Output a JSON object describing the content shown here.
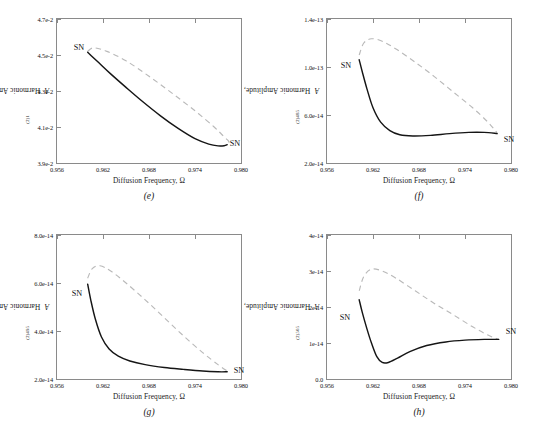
{
  "figure": {
    "panels": [
      {
        "id": "e",
        "caption": "(e)",
        "xlabel_text": "Diffusion Frequency, Ω",
        "ylabel_prefix": "Harmonic Amplitude, ",
        "ylabel_symbol": "A",
        "ylabel_sub": "(2)1",
        "xticks": [
          "0.956",
          "0.962",
          "0.968",
          "0.974",
          "0.980"
        ],
        "yticks": [
          "4.7e-2",
          "4.5e-2",
          "4.3e-2",
          "4.1e-2",
          "3.9e-2"
        ],
        "sn_labels": [
          "SN",
          "SN"
        ]
      },
      {
        "id": "f",
        "caption": "(f)",
        "xlabel_text": "Diffusion Frequency, Ω",
        "ylabel_prefix": "Harmonic Amplitude, ",
        "ylabel_symbol": "A",
        "ylabel_sub": "(2)485",
        "xticks": [
          "0.956",
          "0.962",
          "0.968",
          "0.974",
          "0.980"
        ],
        "yticks": [
          "1.4e-13",
          "1.0e-13",
          "6.0e-14",
          "2.0e-14"
        ],
        "sn_labels": [
          "SN",
          "SN"
        ]
      },
      {
        "id": "g",
        "caption": "(g)",
        "xlabel_text": "Diffusion Frequency, Ω",
        "ylabel_prefix": "Harmonic Amplitude, ",
        "ylabel_symbol": "A",
        "ylabel_sub": "(2)495",
        "xticks": [
          "0.956",
          "0.962",
          "0.968",
          "0.974",
          "0.980"
        ],
        "yticks": [
          "8.0e-14",
          "6.0e-14",
          "4.0e-14",
          "2.0e-14"
        ],
        "sn_labels": [
          "SN",
          "SN"
        ]
      },
      {
        "id": "h",
        "caption": "(h)",
        "xlabel_text": "Diffusion Frequency, Ω",
        "ylabel_prefix": "Harmonic Amplitude, ",
        "ylabel_symbol": "A",
        "ylabel_sub": "(2)505",
        "xticks": [
          "0.956",
          "0.962",
          "0.968",
          "0.974",
          "0.980"
        ],
        "yticks": [
          "4e-14",
          "3e-14",
          "2e-14",
          "1e-14",
          "0.0"
        ],
        "sn_labels": [
          "SN",
          "SN"
        ]
      }
    ]
  },
  "chart_data": [
    {
      "type": "line",
      "panel": "e",
      "title": "(e)",
      "xlabel": "Diffusion Frequency, Ω",
      "ylabel": "Harmonic Amplitude, A(2)1",
      "xlim": [
        0.956,
        0.98
      ],
      "ylim": [
        0.039,
        0.047
      ],
      "grid": false,
      "legend": "none",
      "annotations": [
        {
          "text": "SN",
          "x": 0.9595,
          "y": 0.0452
        },
        {
          "text": "SN",
          "x": 0.9788,
          "y": 0.04
        }
      ],
      "series": [
        {
          "name": "stable branch (solid)",
          "style": "solid",
          "color": "#151515",
          "x": [
            0.96,
            0.9605,
            0.9615,
            0.963,
            0.965,
            0.9672,
            0.9695,
            0.9718,
            0.974,
            0.9758,
            0.977,
            0.9778,
            0.9782
          ],
          "y": [
            0.04515,
            0.04495,
            0.04455,
            0.04395,
            0.0432,
            0.0424,
            0.04162,
            0.04092,
            0.04035,
            0.04005,
            0.03995,
            0.03996,
            0.04002
          ]
        },
        {
          "name": "unstable branch (dashed)",
          "style": "dashed",
          "color": "#b9b9b9",
          "x": [
            0.96,
            0.9608,
            0.9625,
            0.965,
            0.968,
            0.971,
            0.974,
            0.9765,
            0.9778,
            0.9784,
            0.9784
          ],
          "y": [
            0.0452,
            0.0454,
            0.0452,
            0.04468,
            0.04382,
            0.04288,
            0.0419,
            0.041,
            0.04045,
            0.0402,
            0.04002
          ]
        }
      ]
    },
    {
      "type": "line",
      "panel": "f",
      "title": "(f)",
      "xlabel": "Diffusion Frequency, Ω",
      "ylabel": "Harmonic Amplitude, A(2)485",
      "xlim": [
        0.956,
        0.98
      ],
      "ylim": [
        2e-14,
        1.4e-13
      ],
      "grid": false,
      "legend": "none",
      "annotations": [
        {
          "text": "SN",
          "x": 0.9592,
          "y": 1.03e-13
        },
        {
          "text": "SN",
          "x": 0.9792,
          "y": 4.6e-14
        }
      ],
      "series": [
        {
          "name": "stable branch (solid)",
          "style": "solid",
          "color": "#151515",
          "x": [
            0.9602,
            0.9606,
            0.9612,
            0.962,
            0.963,
            0.9642,
            0.9655,
            0.9672,
            0.9695,
            0.972,
            0.9745,
            0.9765,
            0.9782
          ],
          "y": [
            1.06e-13,
            9.6e-14,
            8.2e-14,
            6.6e-14,
            5.4e-14,
            4.7e-14,
            4.35e-14,
            4.25e-14,
            4.3e-14,
            4.45e-14,
            4.55e-14,
            4.55e-14,
            4.45e-14
          ]
        },
        {
          "name": "unstable branch (dashed)",
          "style": "dashed",
          "color": "#b9b9b9",
          "x": [
            0.9602,
            0.9608,
            0.9618,
            0.9632,
            0.965,
            0.9675,
            0.97,
            0.9725,
            0.975,
            0.977,
            0.9782
          ],
          "y": [
            1.1e-13,
            1.2e-13,
            1.235e-13,
            1.215e-13,
            1.15e-13,
            1.04e-13,
            9.2e-14,
            7.9e-14,
            6.6e-14,
            5.4e-14,
            4.5e-14
          ]
        }
      ]
    },
    {
      "type": "line",
      "panel": "g",
      "title": "(g)",
      "xlabel": "Diffusion Frequency, Ω",
      "ylabel": "Harmonic Amplitude, A(2)495",
      "xlim": [
        0.956,
        0.98
      ],
      "ylim": [
        2e-14,
        8e-14
      ],
      "grid": false,
      "legend": "none",
      "annotations": [
        {
          "text": "SN",
          "x": 0.9593,
          "y": 5.75e-14
        },
        {
          "text": "SN",
          "x": 0.9792,
          "y": 2.35e-14
        }
      ],
      "series": [
        {
          "name": "stable branch (solid)",
          "style": "solid",
          "color": "#151515",
          "x": [
            0.96,
            0.9604,
            0.961,
            0.9618,
            0.9628,
            0.964,
            0.9655,
            0.9675,
            0.97,
            0.9725,
            0.975,
            0.977,
            0.9782
          ],
          "y": [
            5.95e-14,
            5.3e-14,
            4.5e-14,
            3.75e-14,
            3.25e-14,
            2.95e-14,
            2.75e-14,
            2.6e-14,
            2.48e-14,
            2.4e-14,
            2.33e-14,
            2.3e-14,
            2.3e-14
          ]
        },
        {
          "name": "unstable branch (dashed)",
          "style": "dashed",
          "color": "#b9b9b9",
          "x": [
            0.96,
            0.9606,
            0.9616,
            0.963,
            0.965,
            0.9675,
            0.97,
            0.9725,
            0.975,
            0.977,
            0.9782
          ],
          "y": [
            6.2e-14,
            6.6e-14,
            6.72e-14,
            6.5e-14,
            6e-14,
            5.3e-14,
            4.55e-14,
            3.8e-14,
            3.1e-14,
            2.6e-14,
            2.33e-14
          ]
        }
      ]
    },
    {
      "type": "line",
      "panel": "h",
      "title": "(h)",
      "xlabel": "Diffusion Frequency, Ω",
      "ylabel": "Harmonic Amplitude, A(2)505",
      "xlim": [
        0.956,
        0.98
      ],
      "ylim": [
        0,
        4e-14
      ],
      "grid": false,
      "legend": "none",
      "annotations": [
        {
          "text": "SN",
          "x": 0.9592,
          "y": 2.15e-14
        },
        {
          "text": "SN",
          "x": 0.9795,
          "y": 1.1e-14
        }
      ],
      "series": [
        {
          "name": "stable branch (solid)",
          "style": "solid",
          "color": "#151515",
          "x": [
            0.9602,
            0.9606,
            0.9612,
            0.9618,
            0.9625,
            0.9632,
            0.964,
            0.9652,
            0.9668,
            0.969,
            0.9715,
            0.974,
            0.9765,
            0.9784
          ],
          "y": [
            2.2e-14,
            1.85e-14,
            1.4e-14,
            1e-14,
            6.2e-15,
            4.6e-15,
            4.6e-15,
            5.8e-15,
            7.6e-15,
            9.3e-15,
            1.03e-14,
            1.08e-14,
            1.1e-14,
            1.1e-14
          ]
        },
        {
          "name": "unstable branch (dashed)",
          "style": "dashed",
          "color": "#b9b9b9",
          "x": [
            0.9602,
            0.9608,
            0.9618,
            0.9632,
            0.965,
            0.9675,
            0.97,
            0.9725,
            0.975,
            0.977,
            0.9784
          ],
          "y": [
            2.45e-14,
            2.85e-14,
            3.05e-14,
            3e-14,
            2.8e-14,
            2.45e-14,
            2.1e-14,
            1.78e-14,
            1.45e-14,
            1.22e-14,
            1.1e-14
          ]
        }
      ]
    }
  ]
}
